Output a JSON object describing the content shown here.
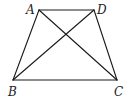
{
  "diagram": {
    "type": "trapezoid",
    "stroke_color": "#1a1a1a",
    "label_color": "#222222",
    "vertices": {
      "A": {
        "label": "A",
        "x": 39,
        "y": 10,
        "lx": 26,
        "ly": 14
      },
      "D": {
        "label": "D",
        "x": 94,
        "y": 10,
        "lx": 97,
        "ly": 14
      },
      "B": {
        "label": "B",
        "x": 13,
        "y": 80,
        "lx": 8,
        "ly": 96
      },
      "C": {
        "label": "C",
        "x": 117,
        "y": 80,
        "lx": 114,
        "ly": 96
      }
    },
    "edges": [
      {
        "name": "AD",
        "from": "A",
        "to": "D"
      },
      {
        "name": "AB",
        "from": "A",
        "to": "B"
      },
      {
        "name": "BC",
        "from": "B",
        "to": "C"
      },
      {
        "name": "DC",
        "from": "D",
        "to": "C"
      },
      {
        "name": "AC",
        "from": "A",
        "to": "C"
      },
      {
        "name": "BD",
        "from": "B",
        "to": "D"
      }
    ]
  }
}
